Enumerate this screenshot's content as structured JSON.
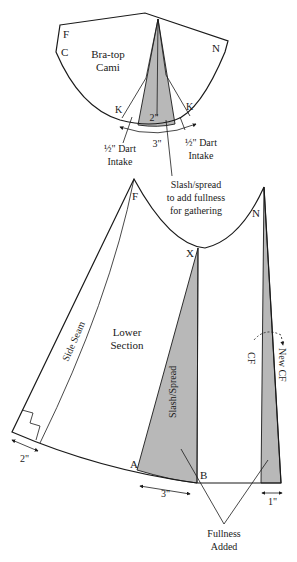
{
  "diagram": {
    "top_piece": {
      "label_line1": "Bra-top",
      "label_line2": "Cami",
      "point_f": "F",
      "point_c": "C",
      "point_n": "N",
      "point_k_left": "K",
      "point_k_right": "K",
      "dart_depth": "2\"",
      "arc_width": "3\"",
      "left_dart_line1": "½\" Dart",
      "left_dart_line2": "Intake",
      "right_dart_line1": "½\" Dart",
      "right_dart_line2": "Intake"
    },
    "callout": {
      "line1": "Slash/spread",
      "line2": "to add fullness",
      "line3": "for gathering"
    },
    "lower_piece": {
      "label_line1": "Lower",
      "label_line2": "Section",
      "point_f": "F",
      "point_n": "N",
      "point_x": "X",
      "point_a": "A",
      "point_b": "B",
      "side_seam": "Side Seam",
      "slash_spread": "Slash/Spread",
      "cf": "CF",
      "new_cf": "New CF",
      "hem_left": "2\"",
      "hem_mid": "3\"",
      "hem_right": "1\"",
      "fullness_line1": "Fullness",
      "fullness_line2": "Added"
    }
  }
}
